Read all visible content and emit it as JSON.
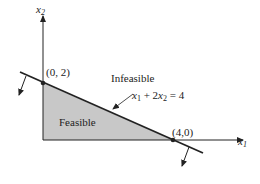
{
  "axes": {
    "x_label": "x",
    "x_sub": "1",
    "y_label": "x",
    "y_sub": "2"
  },
  "points": [
    {
      "label": "(0, 2)",
      "x": 0,
      "y": 2
    },
    {
      "label": "(4,0)",
      "x": 4,
      "y": 0
    }
  ],
  "constraint": {
    "equation_parts": {
      "a": "x",
      "a_sub": "1",
      "mid": " + 2",
      "b": "x",
      "b_sub": "2",
      "rhs": " = 4"
    }
  },
  "regions": {
    "feasible": "Feasible",
    "infeasible": "Infeasible"
  },
  "colors": {
    "feasible_fill": "#c8c8c8",
    "line": "#222222"
  }
}
